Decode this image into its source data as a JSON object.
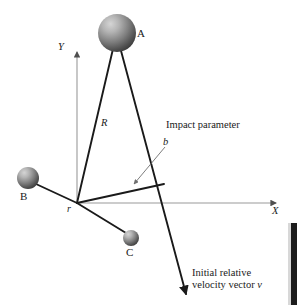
{
  "figure": {
    "type": "physics-scattering-diagram",
    "background_color": "#ffffff",
    "line_color": "#1a1a1a",
    "axis_color": "#8a8a8a",
    "leader_color": "#6f6f6f",
    "width": 297,
    "height": 305
  },
  "spheres": [
    {
      "id": "A",
      "label": "A",
      "cx": 117,
      "cy": 33,
      "r": 19,
      "fill_light": "#bdbdbd",
      "fill_dark": "#4a4a4a"
    },
    {
      "id": "B",
      "label": "B",
      "cx": 28,
      "cy": 178,
      "r": 11,
      "fill_light": "#bdbdbd",
      "fill_dark": "#4a4a4a"
    },
    {
      "id": "C",
      "label": "C",
      "cx": 131,
      "cy": 238,
      "r": 8,
      "fill_light": "#bdbdbd",
      "fill_dark": "#4a4a4a"
    }
  ],
  "axes": {
    "x_label": "X",
    "y_label": "Y",
    "origin": {
      "x": 77,
      "y": 203,
      "label": "r"
    },
    "x_axis": {
      "x1": 77,
      "y1": 203,
      "x2": 279,
      "y2": 203
    },
    "y_axis": {
      "x1": 77,
      "y1": 203,
      "x2": 77,
      "y2": 49
    }
  },
  "segments": [
    {
      "name": "R-line",
      "label": "R",
      "from": {
        "x": 117,
        "y": 33
      },
      "to": {
        "x": 77,
        "y": 203
      }
    },
    {
      "name": "B-line",
      "label": "",
      "from": {
        "x": 36,
        "y": 184
      },
      "to": {
        "x": 77,
        "y": 203
      }
    },
    {
      "name": "C-line",
      "label": "",
      "from": {
        "x": 77,
        "y": 203
      },
      "to": {
        "x": 126,
        "y": 233
      }
    },
    {
      "name": "impact-parameter-line",
      "label": "b",
      "from": {
        "x": 77,
        "y": 203
      },
      "to": {
        "x": 163,
        "y": 184
      }
    }
  ],
  "velocity_vector": {
    "name": "initial-relative-velocity-vector",
    "from": {
      "x": 120,
      "y": 46
    },
    "to": {
      "x": 186,
      "y": 295
    },
    "label_line1": "Initial relative",
    "label_line2": "velocity vector ",
    "label_symbol": "v"
  },
  "annotations": {
    "impact_parameter_text": "Impact parameter",
    "impact_parameter_symbol": "b",
    "leader": {
      "from": {
        "x": 164,
        "y": 148
      },
      "to": {
        "x": 133,
        "y": 185
      }
    }
  },
  "labels": {
    "sphere_a": "A",
    "sphere_b": "B",
    "sphere_c": "C",
    "axis_x": "X",
    "axis_y": "Y",
    "origin_r": "r",
    "radius_R": "R",
    "impact_b": "b"
  }
}
